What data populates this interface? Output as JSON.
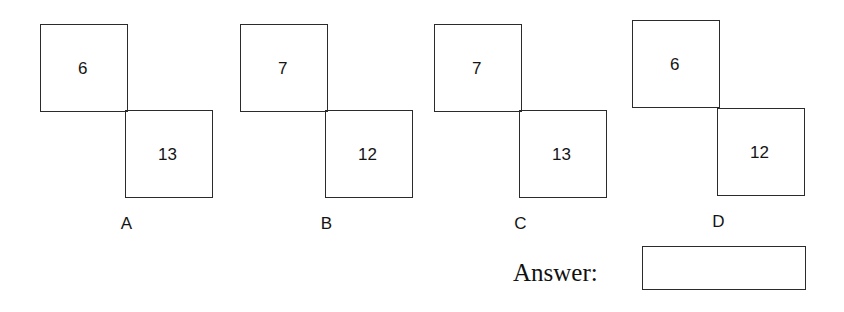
{
  "page": {
    "background_color": "#ffffff",
    "line_color": "#2b2b2b",
    "text_color": "#141414"
  },
  "options": [
    {
      "letter": "A",
      "top_square_value": "6",
      "bottom_square_value": "13"
    },
    {
      "letter": "B",
      "top_square_value": "7",
      "bottom_square_value": "12"
    },
    {
      "letter": "C",
      "top_square_value": "7",
      "bottom_square_value": "13"
    },
    {
      "letter": "D",
      "top_square_value": "6",
      "bottom_square_value": "12"
    }
  ],
  "answer": {
    "label": "Answer:",
    "value": ""
  }
}
